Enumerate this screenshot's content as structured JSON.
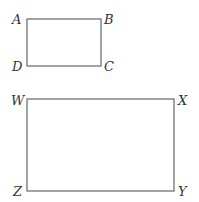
{
  "diagram": {
    "rectangles": [
      {
        "name": "ABCD",
        "x": 27,
        "y": 19,
        "width": 74,
        "height": 47,
        "labels": {
          "top_left": "A",
          "top_right": "B",
          "bottom_right": "C",
          "bottom_left": "D"
        }
      },
      {
        "name": "WXYZ",
        "x": 27,
        "y": 99,
        "width": 147,
        "height": 92,
        "labels": {
          "top_left": "W",
          "top_right": "X",
          "bottom_right": "Y",
          "bottom_left": "Z"
        }
      }
    ],
    "stroke_color": "#666666",
    "label_color": "#333333"
  }
}
